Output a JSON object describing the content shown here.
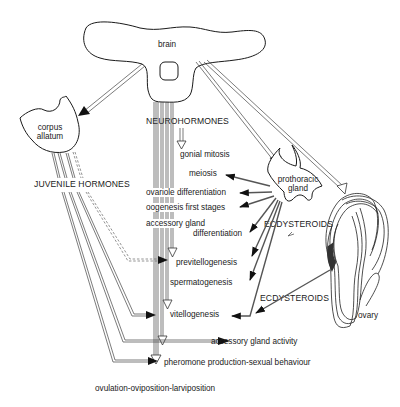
{
  "diagram": {
    "type": "biological-flow-diagram",
    "organs": {
      "brain": "brain",
      "corpus_allatum_line1": "corpus",
      "corpus_allatum_line2": "allatum",
      "prothoracic_gland_line1": "prothoracic",
      "prothoracic_gland_line2": "gland",
      "ovary": "ovary"
    },
    "hormones": {
      "neurohormones": "NEUROHORMONES",
      "juvenile_hormones": "JUVENILE HORMONES",
      "ecdysteroids_gland": "ECDYSTEROIDS",
      "ecdysteroids_ovary": "ECDYSTEROIDS"
    },
    "processes": [
      "gonial mitosis",
      "meiosis",
      "ovariole differentiation",
      "oogenesis first stages",
      "accessory gland",
      "differentiation",
      "previtellogenesis",
      "spermatogenesis",
      "vitellogenesis",
      "accessory gland activity",
      "pheromone production-sexual behaviour",
      "ovulation-oviposition-larviposition"
    ],
    "connections": [
      {
        "from": "brain",
        "to": "corpus allatum",
        "arrow": "solid"
      },
      {
        "from": "brain",
        "to": "prothoracic gland",
        "arrow": "open"
      },
      {
        "from": "brain",
        "to": "ovary",
        "arrow": "open"
      },
      {
        "from": "neurohormones",
        "to": "gonial mitosis",
        "arrow": "open"
      },
      {
        "from": "neurohormones",
        "to": "previtellogenesis",
        "arrow": "open"
      },
      {
        "from": "neurohormones",
        "to": "vitellogenesis",
        "arrow": "open"
      },
      {
        "from": "neurohormones",
        "to": "pheromone production-sexual behaviour",
        "arrow": "open"
      },
      {
        "from": "neurohormones",
        "to": "ovulation-oviposition-larviposition",
        "arrow": "open"
      },
      {
        "from": "prothoracic gland",
        "to": "meiosis",
        "arrow": "solid"
      },
      {
        "from": "prothoracic gland",
        "to": "ovariole differentiation",
        "arrow": "solid"
      },
      {
        "from": "prothoracic gland",
        "to": "oogenesis first stages",
        "arrow": "solid"
      },
      {
        "from": "prothoracic gland",
        "to": "accessory gland differentiation",
        "arrow": "solid"
      },
      {
        "from": "prothoracic gland",
        "to": "previtellogenesis",
        "arrow": "solid"
      },
      {
        "from": "prothoracic gland",
        "to": "spermatogenesis",
        "arrow": "solid"
      },
      {
        "from": "prothoracic gland",
        "to": "vitellogenesis",
        "arrow": "solid"
      },
      {
        "from": "ovary",
        "to": "vitellogenesis",
        "arrow": "solid"
      },
      {
        "from": "juvenile hormones",
        "to": "previtellogenesis",
        "arrow": "solid",
        "style": "dashed"
      },
      {
        "from": "juvenile hormones",
        "to": "vitellogenesis",
        "arrow": "solid"
      },
      {
        "from": "juvenile hormones",
        "to": "accessory gland activity",
        "arrow": "solid"
      },
      {
        "from": "juvenile hormones",
        "to": "pheromone production-sexual behaviour",
        "arrow": "solid"
      }
    ]
  }
}
